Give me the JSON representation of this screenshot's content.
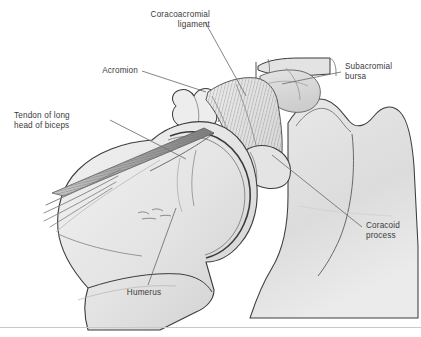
{
  "figure": {
    "background_color": "#ffffff",
    "border_color": "#c9c9c9",
    "label_color": "#3b3b3b",
    "leader_line_color": "#6e6e6e",
    "outline_color": "#3c3c3c",
    "bone_fill_light": "#ededed",
    "bone_fill_mid": "#e0e0e0",
    "bone_fill_dark": "#cfcfcf",
    "tendon_color": "#8e8e8e"
  },
  "labels": [
    {
      "id": "coracoacromial-ligament",
      "text": "Coracoacromial\nligament",
      "align": "right",
      "x": 92,
      "y": 10,
      "width": 118
    },
    {
      "id": "acromion",
      "text": "Acromion",
      "align": "right",
      "x": 60,
      "y": 66,
      "width": 78
    },
    {
      "id": "subacromial-bursa",
      "text": "Subacromial\nbursa",
      "align": "left",
      "x": 345,
      "y": 62,
      "width": 74
    },
    {
      "id": "tendon-of-long-head-of-biceps",
      "text": "Tendon of long\nhead of biceps",
      "align": "left",
      "x": 14,
      "y": 111,
      "width": 92
    },
    {
      "id": "coracoid-process",
      "text": "Coracoid\nprocess",
      "align": "left",
      "x": 366,
      "y": 221,
      "width": 58
    },
    {
      "id": "humerus",
      "text": "Humerus",
      "align": "center",
      "x": 108,
      "y": 288,
      "width": 72
    }
  ],
  "structures": [
    {
      "id": "clavicle",
      "name": "Clavicle"
    },
    {
      "id": "acromion",
      "name": "Acromion"
    },
    {
      "id": "coracoacromial-ligament",
      "name": "Coracoacromial ligament"
    },
    {
      "id": "coracoid-process",
      "name": "Coracoid process"
    },
    {
      "id": "subacromial-bursa",
      "name": "Subacromial bursa"
    },
    {
      "id": "scapula",
      "name": "Scapula"
    },
    {
      "id": "humeral-head",
      "name": "Humeral head"
    },
    {
      "id": "humerus-shaft",
      "name": "Humerus shaft"
    },
    {
      "id": "biceps-tendon",
      "name": "Tendon of long head of biceps"
    }
  ]
}
